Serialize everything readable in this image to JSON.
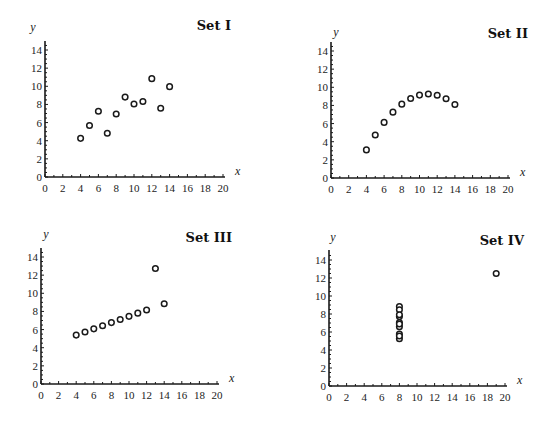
{
  "chart_data": [
    {
      "type": "scatter",
      "title": "Set I",
      "xlabel": "x",
      "ylabel": "y",
      "xlim": [
        0,
        20
      ],
      "ylim": [
        0,
        14
      ],
      "xticks": [
        0,
        2,
        4,
        6,
        8,
        10,
        12,
        14,
        16,
        18,
        20
      ],
      "yticks": [
        0,
        2,
        4,
        6,
        8,
        10,
        12,
        14
      ],
      "grid": false,
      "x": [
        10,
        8,
        13,
        9,
        11,
        14,
        6,
        4,
        12,
        7,
        5
      ],
      "y": [
        8.04,
        6.95,
        7.58,
        8.81,
        8.33,
        9.96,
        7.24,
        4.26,
        10.84,
        4.82,
        5.68
      ]
    },
    {
      "type": "scatter",
      "title": "Set II",
      "xlabel": "x",
      "ylabel": "y",
      "xlim": [
        0,
        20
      ],
      "ylim": [
        0,
        14
      ],
      "xticks": [
        0,
        2,
        4,
        6,
        8,
        10,
        12,
        14,
        16,
        18,
        20
      ],
      "yticks": [
        0,
        2,
        4,
        6,
        8,
        10,
        12,
        14
      ],
      "grid": false,
      "x": [
        10,
        8,
        13,
        9,
        11,
        14,
        6,
        4,
        12,
        7,
        5
      ],
      "y": [
        9.14,
        8.14,
        8.74,
        8.77,
        9.26,
        8.1,
        6.13,
        3.1,
        9.13,
        7.26,
        4.74
      ]
    },
    {
      "type": "scatter",
      "title": "Set III",
      "xlabel": "x",
      "ylabel": "y",
      "xlim": [
        0,
        20
      ],
      "ylim": [
        0,
        14
      ],
      "xticks": [
        0,
        2,
        4,
        6,
        8,
        10,
        12,
        14,
        16,
        18,
        20
      ],
      "yticks": [
        0,
        2,
        4,
        6,
        8,
        10,
        12,
        14
      ],
      "grid": false,
      "x": [
        10,
        8,
        13,
        9,
        11,
        14,
        6,
        4,
        12,
        7,
        5
      ],
      "y": [
        7.46,
        6.77,
        12.74,
        7.11,
        7.81,
        8.84,
        6.08,
        5.39,
        8.15,
        6.42,
        5.73
      ]
    },
    {
      "type": "scatter",
      "title": "Set IV",
      "xlabel": "x",
      "ylabel": "y",
      "xlim": [
        0,
        20
      ],
      "ylim": [
        0,
        14
      ],
      "xticks": [
        0,
        2,
        4,
        6,
        8,
        10,
        12,
        14,
        16,
        18,
        20
      ],
      "yticks": [
        0,
        2,
        4,
        6,
        8,
        10,
        12,
        14
      ],
      "grid": false,
      "x": [
        8,
        8,
        8,
        8,
        8,
        8,
        8,
        19,
        8,
        8,
        8
      ],
      "y": [
        6.58,
        5.76,
        7.71,
        8.84,
        8.47,
        7.04,
        5.25,
        12.5,
        5.56,
        7.91,
        6.89
      ]
    }
  ],
  "layout": {
    "panels": [
      {
        "x0": 45,
        "y0": 177,
        "x20": 223,
        "y14": 50,
        "ytop": 41,
        "title_x": 231,
        "title_y": 30,
        "ylab_x": 33,
        "ylab_y": 31
      },
      {
        "x0": 331,
        "y0": 178,
        "x20": 508,
        "y14": 51,
        "ytop": 42,
        "title_x": 528,
        "title_y": 38,
        "ylab_x": 336,
        "ylab_y": 36
      },
      {
        "x0": 41,
        "y0": 384,
        "x20": 217,
        "y14": 257,
        "ytop": 248,
        "title_x": 232,
        "title_y": 242,
        "ylab_x": 46,
        "ylab_y": 238
      },
      {
        "x0": 329,
        "y0": 386,
        "x20": 505,
        "y14": 260,
        "ytop": 250,
        "title_x": 524,
        "title_y": 245,
        "ylab_x": 333,
        "ylab_y": 241
      }
    ],
    "ink_color": "#1a1a1a"
  }
}
